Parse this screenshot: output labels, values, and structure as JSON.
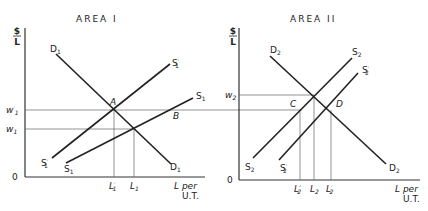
{
  "panels": [
    {
      "title": "AREA I",
      "y_axis_label_top": "$",
      "y_axis_label_bottom": "L",
      "origin_label": "0",
      "x_axis_label_line1": "L per",
      "x_axis_label_line2": "U.T.",
      "wage_labels": [
        {
          "base": "w",
          "sub": "1",
          "prime": "′",
          "note": "upper wage w′1 at point A"
        },
        {
          "base": "w",
          "sub": "1",
          "prime": "",
          "note": "lower wage w1"
        }
      ],
      "curves": [
        {
          "base": "D",
          "sub": "1",
          "prime": "",
          "type": "demand"
        },
        {
          "base": "S",
          "sub": "1",
          "prime": "′",
          "type": "supply"
        },
        {
          "base": "S",
          "sub": "1",
          "prime": "",
          "type": "supply"
        }
      ],
      "points": [
        "A",
        "B"
      ],
      "x_ticks": [
        {
          "base": "L",
          "sub": "1",
          "prime": "′"
        },
        {
          "base": "L",
          "sub": "1",
          "prime": ""
        }
      ]
    },
    {
      "title": "AREA II",
      "y_axis_label_top": "$",
      "y_axis_label_bottom": "L",
      "origin_label": "0",
      "x_axis_label_line1": "L per",
      "x_axis_label_line2": "U.T.",
      "wage_labels": [
        {
          "base": "w",
          "sub": "2",
          "prime": ""
        }
      ],
      "curves": [
        {
          "base": "D",
          "sub": "2",
          "prime": "",
          "type": "demand"
        },
        {
          "base": "S",
          "sub": "2",
          "prime": "",
          "type": "supply"
        },
        {
          "base": "S",
          "sub": "2",
          "prime": "′",
          "type": "supply"
        }
      ],
      "points": [
        "C",
        "D"
      ],
      "x_ticks": [
        {
          "base": "L",
          "sub": "2",
          "prime": "″"
        },
        {
          "base": "L",
          "sub": "2",
          "prime": ""
        },
        {
          "base": "L",
          "sub": "2",
          "prime": "′"
        }
      ]
    }
  ]
}
